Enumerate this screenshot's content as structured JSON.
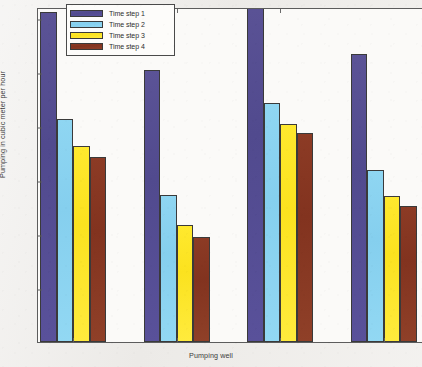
{
  "chart_data": {
    "type": "bar",
    "title": "",
    "xlabel": "Pumping well",
    "ylabel": "Pumping in cubic meter per hour",
    "categories": [
      "1",
      "2",
      "3",
      "4"
    ],
    "ylim": [
      0,
      620
    ],
    "yticks": [
      0,
      100,
      200,
      300,
      400,
      500,
      600
    ],
    "ytick_labels": [
      "0",
      "100",
      "200",
      "300",
      "400",
      "500",
      "600"
    ],
    "grid": false,
    "legend_position": "top-center",
    "series": [
      {
        "name": "Time step 1",
        "color": "#544c92",
        "values": [
          610,
          503,
          645,
          533
        ]
      },
      {
        "name": "Time step 2",
        "color": "#8ad3f0",
        "values": [
          412,
          273,
          443,
          318
        ]
      },
      {
        "name": "Time step 3",
        "color": "#fce626",
        "values": [
          363,
          217,
          403,
          270
        ]
      },
      {
        "name": "Time step 4",
        "color": "#86351f",
        "values": [
          343,
          195,
          387,
          252
        ]
      }
    ]
  }
}
